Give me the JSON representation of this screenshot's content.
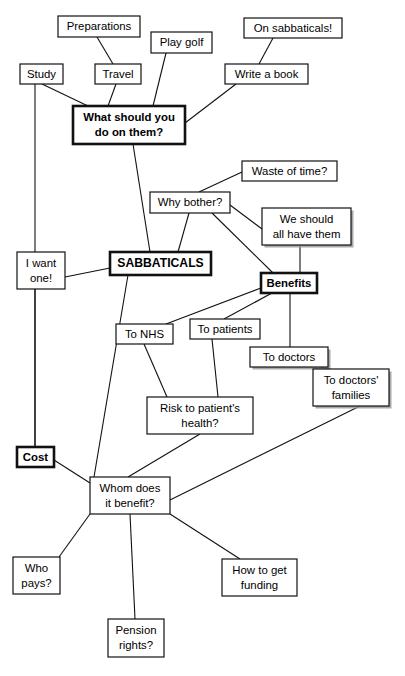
{
  "diagram": {
    "title": "SABBATICALS",
    "type": "mind-map",
    "canvas": {
      "width": 405,
      "height": 676
    },
    "background": "#ffffff",
    "line_color": "#111111",
    "text_color": "#000000",
    "clipped_header_text": "",
    "nodes": [
      {
        "id": "preparations",
        "lines": [
          "Preparations"
        ],
        "x": 58,
        "y": 16,
        "w": 82,
        "h": 21,
        "emphasis": false,
        "shadow": false
      },
      {
        "id": "study",
        "lines": [
          "Study"
        ],
        "x": 20,
        "y": 64,
        "w": 43,
        "h": 20,
        "emphasis": false,
        "shadow": false
      },
      {
        "id": "travel",
        "lines": [
          "Travel"
        ],
        "x": 95,
        "y": 64,
        "w": 46,
        "h": 20,
        "emphasis": false,
        "shadow": false
      },
      {
        "id": "play-golf",
        "lines": [
          "Play golf"
        ],
        "x": 151,
        "y": 32,
        "w": 61,
        "h": 21,
        "emphasis": false,
        "shadow": false
      },
      {
        "id": "on-sabbaticals",
        "lines": [
          "On sabbaticals!"
        ],
        "x": 244,
        "y": 18,
        "w": 98,
        "h": 20,
        "emphasis": false,
        "shadow": false
      },
      {
        "id": "write-a-book",
        "lines": [
          "Write a book"
        ],
        "x": 225,
        "y": 64,
        "w": 83,
        "h": 20,
        "emphasis": false,
        "shadow": false
      },
      {
        "id": "what-should-you-do",
        "lines": [
          "What should you",
          "do on them?"
        ],
        "x": 73,
        "y": 106,
        "w": 112,
        "h": 38,
        "emphasis": true,
        "shadow": false
      },
      {
        "id": "waste-of-time",
        "lines": [
          "Waste of time?"
        ],
        "x": 242,
        "y": 161,
        "w": 95,
        "h": 20,
        "emphasis": false,
        "shadow": false
      },
      {
        "id": "why-bother",
        "lines": [
          "Why bother?"
        ],
        "x": 150,
        "y": 192,
        "w": 80,
        "h": 21,
        "emphasis": false,
        "shadow": false
      },
      {
        "id": "we-should-all-have-them",
        "lines": [
          "We should",
          "all have them"
        ],
        "x": 262,
        "y": 208,
        "w": 89,
        "h": 37,
        "emphasis": false,
        "shadow": true
      },
      {
        "id": "i-want-one",
        "lines": [
          "I want",
          "one!"
        ],
        "x": 17,
        "y": 252,
        "w": 48,
        "h": 37,
        "emphasis": false,
        "shadow": false
      },
      {
        "id": "sabbaticals",
        "lines": [
          "SABBATICALS"
        ],
        "x": 110,
        "y": 252,
        "w": 101,
        "h": 23,
        "emphasis": true,
        "shadow": false
      },
      {
        "id": "benefits",
        "lines": [
          "Benefits"
        ],
        "x": 261,
        "y": 273,
        "w": 56,
        "h": 20,
        "emphasis": true,
        "shadow": false
      },
      {
        "id": "to-patients",
        "lines": [
          "To patients"
        ],
        "x": 190,
        "y": 319,
        "w": 70,
        "h": 20,
        "emphasis": false,
        "shadow": false
      },
      {
        "id": "to-nhs",
        "lines": [
          "To NHS"
        ],
        "x": 116,
        "y": 324,
        "w": 57,
        "h": 20,
        "emphasis": false,
        "shadow": false
      },
      {
        "id": "to-doctors",
        "lines": [
          "To doctors"
        ],
        "x": 250,
        "y": 347,
        "w": 78,
        "h": 20,
        "emphasis": false,
        "shadow": true
      },
      {
        "id": "to-doctors-families",
        "lines": [
          "To doctors'",
          "families"
        ],
        "x": 313,
        "y": 369,
        "w": 76,
        "h": 37,
        "emphasis": false,
        "shadow": true
      },
      {
        "id": "risk-to-patients-health",
        "lines": [
          "Risk to patient's",
          "health?"
        ],
        "x": 147,
        "y": 397,
        "w": 106,
        "h": 37,
        "emphasis": false,
        "shadow": false
      },
      {
        "id": "cost",
        "lines": [
          "Cost"
        ],
        "x": 17,
        "y": 447,
        "w": 37,
        "h": 20,
        "emphasis": true,
        "shadow": false
      },
      {
        "id": "whom-does-it-benefit",
        "lines": [
          "Whom does",
          "it benefit?"
        ],
        "x": 90,
        "y": 477,
        "w": 80,
        "h": 37,
        "emphasis": false,
        "shadow": false
      },
      {
        "id": "who-pays",
        "lines": [
          "Who",
          "pays?"
        ],
        "x": 13,
        "y": 557,
        "w": 47,
        "h": 37,
        "emphasis": false,
        "shadow": false
      },
      {
        "id": "how-to-get-funding",
        "lines": [
          "How to get",
          "funding"
        ],
        "x": 222,
        "y": 559,
        "w": 75,
        "h": 37,
        "emphasis": false,
        "shadow": false
      },
      {
        "id": "pension-rights",
        "lines": [
          "Pension",
          "rights?"
        ],
        "x": 108,
        "y": 619,
        "w": 56,
        "h": 38,
        "emphasis": false,
        "shadow": false
      }
    ],
    "edges": [
      {
        "from": "preparations",
        "to": "travel",
        "x1": 97,
        "y1": 37,
        "x2": 113,
        "y2": 64
      },
      {
        "from": "study",
        "to": "what-should-you-do",
        "x1": 42,
        "y1": 84,
        "x2": 88,
        "y2": 106
      },
      {
        "from": "travel",
        "to": "what-should-you-do",
        "x1": 116,
        "y1": 84,
        "x2": 108,
        "y2": 106
      },
      {
        "from": "play-golf",
        "to": "what-should-you-do",
        "x1": 166,
        "y1": 53,
        "x2": 153,
        "y2": 106
      },
      {
        "from": "on-sabbaticals",
        "to": "write-a-book",
        "x1": 273,
        "y1": 38,
        "x2": 259,
        "y2": 64
      },
      {
        "from": "write-a-book",
        "to": "what-should-you-do",
        "x1": 236,
        "y1": 84,
        "x2": 185,
        "y2": 123
      },
      {
        "from": "study",
        "to": "cost",
        "x1": 35,
        "y1": 84,
        "x2": 35,
        "y2": 447
      },
      {
        "from": "what-should-you-do",
        "to": "sabbaticals",
        "x1": 133,
        "y1": 144,
        "x2": 150,
        "y2": 252
      },
      {
        "from": "waste-of-time",
        "to": "why-bother",
        "x1": 242,
        "y1": 172,
        "x2": 199,
        "y2": 192
      },
      {
        "from": "why-bother",
        "to": "sabbaticals",
        "x1": 189,
        "y1": 213,
        "x2": 178,
        "y2": 252
      },
      {
        "from": "why-bother",
        "to": "we-should-all-have-them",
        "x1": 230,
        "y1": 205,
        "x2": 262,
        "y2": 229
      },
      {
        "from": "why-bother",
        "to": "benefits",
        "x1": 212,
        "y1": 213,
        "x2": 273,
        "y2": 273
      },
      {
        "from": "we-should-all-have-them",
        "to": "benefits",
        "x1": 300,
        "y1": 245,
        "x2": 300,
        "y2": 273
      },
      {
        "from": "i-want-one",
        "to": "sabbaticals",
        "x1": 65,
        "y1": 277,
        "x2": 110,
        "y2": 268
      },
      {
        "from": "i-want-one",
        "to": "cost",
        "x1": 35,
        "y1": 289,
        "x2": 35,
        "y2": 447
      },
      {
        "from": "sabbaticals",
        "to": "whom-does-it-benefit",
        "x1": 128,
        "y1": 275,
        "x2": 94,
        "y2": 477
      },
      {
        "from": "benefits",
        "to": "to-nhs",
        "x1": 261,
        "y1": 288,
        "x2": 166,
        "y2": 324
      },
      {
        "from": "benefits",
        "to": "to-patients",
        "x1": 272,
        "y1": 293,
        "x2": 224,
        "y2": 319
      },
      {
        "from": "benefits",
        "to": "to-doctors",
        "x1": 290,
        "y1": 293,
        "x2": 290,
        "y2": 347
      },
      {
        "from": "to-doctors",
        "to": "to-doctors-families",
        "x1": 320,
        "y1": 367,
        "x2": 330,
        "y2": 369
      },
      {
        "from": "to-nhs",
        "to": "risk-to-patients-health",
        "x1": 144,
        "y1": 344,
        "x2": 167,
        "y2": 397
      },
      {
        "from": "to-patients",
        "to": "risk-to-patients-health",
        "x1": 212,
        "y1": 339,
        "x2": 218,
        "y2": 397
      },
      {
        "from": "risk-to-patients-health",
        "to": "whom-does-it-benefit",
        "x1": 200,
        "y1": 434,
        "x2": 128,
        "y2": 477
      },
      {
        "from": "to-doctors-families",
        "to": "whom-does-it-benefit",
        "x1": 360,
        "y1": 406,
        "x2": 170,
        "y2": 500
      },
      {
        "from": "cost",
        "to": "whom-does-it-benefit",
        "x1": 54,
        "y1": 460,
        "x2": 90,
        "y2": 483
      },
      {
        "from": "whom-does-it-benefit",
        "to": "who-pays",
        "x1": 90,
        "y1": 514,
        "x2": 59,
        "y2": 557
      },
      {
        "from": "whom-does-it-benefit",
        "to": "pension-rights",
        "x1": 130,
        "y1": 514,
        "x2": 135,
        "y2": 619
      },
      {
        "from": "whom-does-it-benefit",
        "to": "how-to-get-funding",
        "x1": 170,
        "y1": 514,
        "x2": 240,
        "y2": 559
      }
    ]
  }
}
